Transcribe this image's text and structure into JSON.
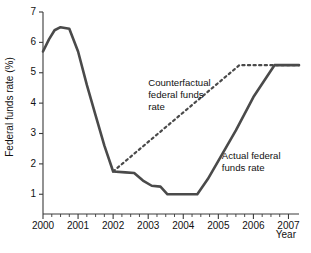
{
  "chart_data": {
    "type": "line",
    "title": "",
    "xlabel": "Year",
    "ylabel": "Federal funds rate (%)",
    "xlim": [
      2000,
      2007.3
    ],
    "ylim": [
      0.35,
      7.0
    ],
    "grid": false,
    "legend_position": "inline-annotations",
    "x_ticks": [
      "2000",
      "2001",
      "2002",
      "2003",
      "2004",
      "2005",
      "2006",
      "2007"
    ],
    "x_tick_values": [
      2000,
      2001,
      2002,
      2003,
      2004,
      2005,
      2006,
      2007
    ],
    "x_minor_tick_interval": 0.25,
    "y_ticks": [
      "1",
      "2",
      "3",
      "4",
      "5",
      "6",
      "7"
    ],
    "y_tick_values": [
      1,
      2,
      3,
      4,
      5,
      6,
      7
    ],
    "series": [
      {
        "name": "Actual federal funds rate",
        "style": "solid",
        "color": "#4a4a4a",
        "x": [
          2000.0,
          2000.17,
          2000.33,
          2000.5,
          2000.75,
          2001.0,
          2001.25,
          2001.5,
          2001.75,
          2002.0,
          2002.35,
          2002.6,
          2002.85,
          2003.1,
          2003.35,
          2003.55,
          2004.4,
          2004.7,
          2005.0,
          2005.5,
          2006.0,
          2006.6,
          2007.3
        ],
        "y": [
          5.7,
          6.1,
          6.4,
          6.5,
          6.45,
          5.7,
          4.6,
          3.6,
          2.6,
          1.75,
          1.72,
          1.7,
          1.45,
          1.28,
          1.25,
          1.0,
          1.0,
          1.5,
          2.1,
          3.1,
          4.2,
          5.25,
          5.25
        ]
      },
      {
        "name": "Counterfactual federal funds rate",
        "style": "dotted",
        "color": "#4a4a4a",
        "x": [
          2002.0,
          2005.6,
          2007.3
        ],
        "y": [
          1.75,
          5.25,
          5.25
        ]
      }
    ],
    "annotations": [
      {
        "name": "counterfactual-label",
        "lines": [
          "Counterfactual",
          "federal funds",
          "rate"
        ],
        "x": 2003.0,
        "y": 4.55
      },
      {
        "name": "actual-label",
        "lines": [
          "Actual federal",
          "funds rate"
        ],
        "x": 2005.1,
        "y": 2.15
      }
    ]
  }
}
